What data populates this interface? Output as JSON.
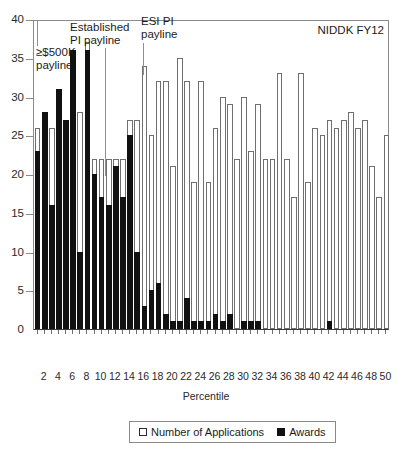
{
  "chart_data": {
    "type": "bar",
    "title": "",
    "corner_label": "NIDDK FY12",
    "xlabel": "Percentile",
    "ylabel": "",
    "ylim": [
      0,
      40
    ],
    "ytick_values": [
      0,
      5,
      10,
      15,
      20,
      25,
      30,
      35,
      40
    ],
    "ytick_labels": [
      "0",
      "5",
      "10",
      "15",
      "20",
      "25",
      "30",
      "35",
      "40"
    ],
    "grid": false,
    "legend_position": "bottom",
    "categories": [
      1,
      2,
      3,
      4,
      5,
      6,
      7,
      8,
      9,
      10,
      11,
      12,
      13,
      14,
      15,
      16,
      17,
      18,
      19,
      20,
      21,
      22,
      23,
      24,
      25,
      26,
      27,
      28,
      29,
      30,
      31,
      32,
      33,
      34,
      35,
      36,
      37,
      38,
      39,
      40,
      41,
      42,
      43,
      44,
      45,
      46,
      47,
      48,
      49,
      50
    ],
    "xtick_labels": [
      "2",
      "4",
      "6",
      "8",
      "10",
      "12",
      "14",
      "16",
      "18",
      "20",
      "22",
      "24",
      "26",
      "28",
      "30",
      "32",
      "34",
      "36",
      "38",
      "40",
      "42",
      "44",
      "46",
      "48",
      "50"
    ],
    "series": [
      {
        "name": "Number of Applications",
        "style": "outlined-white",
        "values": [
          26,
          26,
          26,
          31,
          27,
          32,
          28,
          37,
          22,
          22,
          22,
          22,
          22,
          27,
          27,
          34,
          25,
          32,
          32,
          21,
          35,
          32,
          19,
          32,
          19,
          26,
          30,
          29,
          22,
          30,
          23,
          29,
          22,
          22,
          33,
          22,
          17,
          33,
          19,
          26,
          25,
          27,
          26,
          27,
          28,
          26,
          27,
          21,
          17,
          25
        ]
      },
      {
        "name": "Awards",
        "style": "solid-black",
        "values": [
          23,
          28,
          16,
          31,
          27,
          36,
          10,
          36,
          20,
          17,
          16,
          21,
          17,
          25,
          10,
          3,
          5,
          6,
          2,
          1,
          1,
          4,
          1,
          1,
          1,
          2,
          1,
          2,
          0,
          1,
          1,
          1,
          0,
          0,
          0,
          0,
          0,
          0,
          0,
          0,
          0,
          1,
          0,
          0,
          0,
          0,
          0,
          0,
          0,
          0
        ]
      }
    ],
    "annotations": [
      {
        "text": "≥$500K\npayline",
        "label_x": 36,
        "label_y": 46,
        "line_x": 37,
        "line_top": 20,
        "line_bottom": 46
      },
      {
        "text": "Established\nPI payline",
        "label_x": 70,
        "label_y": 21,
        "line_x": 105,
        "line_top": 48,
        "line_bottom": 176
      },
      {
        "text": "ESI PI\npayline",
        "label_x": 141,
        "label_y": 15,
        "line_x": 143,
        "line_top": 43,
        "line_bottom": 75
      }
    ]
  },
  "legend": {
    "items": [
      {
        "label": "Number of Applications",
        "swatch": "outlined-square-icon"
      },
      {
        "label": "Awards",
        "swatch": "filled-square-icon"
      }
    ]
  }
}
